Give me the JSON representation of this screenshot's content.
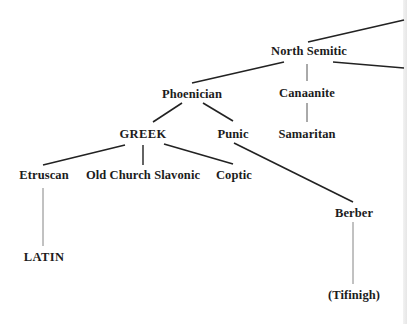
{
  "diagram": {
    "type": "tree",
    "title": "",
    "nodes": {
      "north_semitic": "North Semitic",
      "phoenician": "Phoenician",
      "canaanite": "Canaanite",
      "greek": "GREEK",
      "punic": "Punic",
      "samaritan": "Samaritan",
      "etruscan": "Etruscan",
      "old_church_slavonic": "Old Church Slavonic",
      "coptic": "Coptic",
      "berber": "Berber",
      "latin": "LATIN",
      "tifinigh": "(Tifinigh)"
    },
    "edges": [
      [
        "(offscreen parent)",
        "North Semitic"
      ],
      [
        "North Semitic",
        "Phoenician"
      ],
      [
        "North Semitic",
        "Canaanite"
      ],
      [
        "North Semitic",
        "(offscreen right)"
      ],
      [
        "Phoenician",
        "GREEK"
      ],
      [
        "Phoenician",
        "Punic"
      ],
      [
        "Canaanite",
        "Samaritan"
      ],
      [
        "GREEK",
        "Etruscan"
      ],
      [
        "GREEK",
        "Old Church Slavonic"
      ],
      [
        "GREEK",
        "Coptic"
      ],
      [
        "Punic",
        "Berber"
      ],
      [
        "Etruscan",
        "LATIN"
      ],
      [
        "Berber",
        "(Tifinigh)"
      ]
    ],
    "colors": {
      "text": "#1c1c1c",
      "line": "#222222",
      "thin_line": "#555555",
      "background": "#ffffff"
    }
  }
}
